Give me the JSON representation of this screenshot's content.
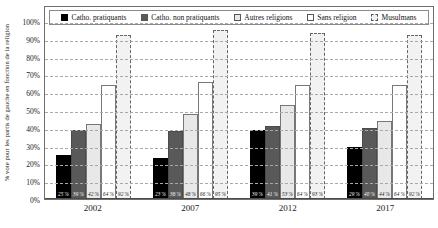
{
  "chart_data": {
    "type": "bar",
    "title": "",
    "xlabel": "",
    "ylabel": "% vote pour les partis de gauche en fonction de la religion",
    "ylim": [
      0,
      100
    ],
    "grid": true,
    "legend_position": "top",
    "categories": [
      "2002",
      "2007",
      "2012",
      "2017"
    ],
    "ytick_labels": [
      "100%",
      "90%",
      "80%",
      "70%",
      "60%",
      "50%",
      "40%",
      "30%",
      "20%",
      "10%",
      "0%"
    ],
    "ytick_values": [
      100,
      90,
      80,
      70,
      60,
      50,
      40,
      30,
      20,
      10,
      0
    ],
    "series": [
      {
        "name": "Catho. pratiquants",
        "color": "#000000",
        "style": "solid",
        "values": [
          25,
          23,
          39,
          29
        ],
        "data_labels": [
          "25 %",
          "23 %",
          "39 %",
          "29 %"
        ]
      },
      {
        "name": "Catho. non pratiquants",
        "color": "#595959",
        "style": "solid",
        "values": [
          39,
          38,
          41,
          40
        ],
        "data_labels": [
          "39 %",
          "38 %",
          "41 %",
          "40 %"
        ]
      },
      {
        "name": "Autres religions",
        "color": "#e8e8e8",
        "style": "solid",
        "values": [
          42,
          48,
          53,
          44
        ],
        "data_labels": [
          "42 %",
          "48 %",
          "53 %",
          "44 %"
        ]
      },
      {
        "name": "Sans religion",
        "color": "#ffffff",
        "style": "solid",
        "values": [
          64,
          66,
          64,
          64
        ],
        "data_labels": [
          "64 %",
          "66 %",
          "64 %",
          "64 %"
        ]
      },
      {
        "name": "Musulmans",
        "color": "#f2f2f2",
        "style": "dashed",
        "values": [
          92,
          95,
          93,
          92
        ],
        "data_labels": [
          "92 %",
          "95 %",
          "93 %",
          "92 %"
        ]
      }
    ]
  }
}
